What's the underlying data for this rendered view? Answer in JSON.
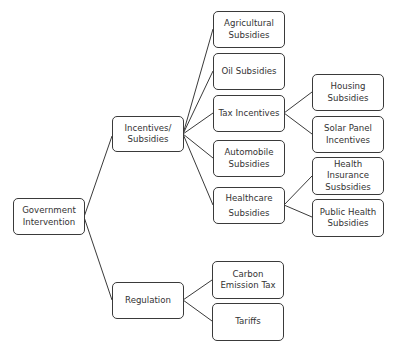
{
  "diagram": {
    "type": "tree",
    "root": "Government Intervention",
    "nodes": {
      "gov": "Government\nIntervention",
      "inc": "Incentives/\nSubsidies",
      "reg": "Regulation",
      "agri": "Agricultural\nSubsidies",
      "oil": "Oil Subsidies",
      "tax": "Tax Incentives",
      "auto": "Automobile\nSubsidies",
      "health": "Healthcare\nSubsidies",
      "carbon": "Carbon\nEmission Tax",
      "tariffs": "Tariffs",
      "housing": "Housing\nSubsidies",
      "solar": "Solar Panel\nIncentives",
      "hins": "Health\nInsurance\nSusbsidies",
      "phealth": "Public Health\nSubsidies"
    },
    "edges": [
      [
        "Government Intervention",
        "Incentives/Subsidies"
      ],
      [
        "Government Intervention",
        "Regulation"
      ],
      [
        "Incentives/Subsidies",
        "Agricultural Subsidies"
      ],
      [
        "Incentives/Subsidies",
        "Oil Subsidies"
      ],
      [
        "Incentives/Subsidies",
        "Tax Incentives"
      ],
      [
        "Incentives/Subsidies",
        "Automobile Subsidies"
      ],
      [
        "Incentives/Subsidies",
        "Healthcare Subsidies"
      ],
      [
        "Tax Incentives",
        "Housing Subsidies"
      ],
      [
        "Tax Incentives",
        "Solar Panel Incentives"
      ],
      [
        "Healthcare Subsidies",
        "Health Insurance Susbsidies"
      ],
      [
        "Healthcare Subsidies",
        "Public Health Subsidies"
      ],
      [
        "Regulation",
        "Carbon Emission Tax"
      ],
      [
        "Regulation",
        "Tariffs"
      ]
    ],
    "colors": {
      "line": "#3a3a3a",
      "text": "#333333",
      "background": "#ffffff"
    }
  }
}
